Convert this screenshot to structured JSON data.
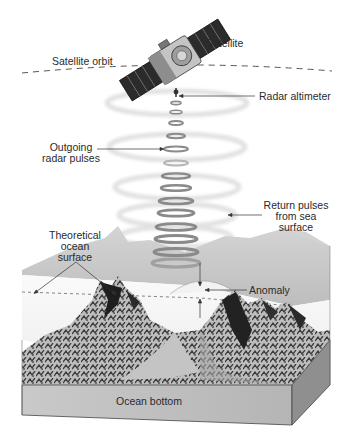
{
  "diagram": {
    "labels": {
      "satellite": "Satellite",
      "satellite_orbit": "Satellite orbit",
      "radar_altimeter": "Radar altimeter",
      "outgoing_pulses_line1": "Outgoing",
      "outgoing_pulses_line2": "radar pulses",
      "return_pulses_line1": "Return pulses",
      "return_pulses_line2": "from sea",
      "return_pulses_line3": "surface",
      "theoretical_line1": "Theoretical",
      "theoretical_line2": "ocean",
      "theoretical_line3": "surface",
      "anomaly": "Anomaly",
      "ocean_bottom": "Ocean bottom"
    },
    "components": [
      "satellite",
      "satellite-orbit",
      "radar-altimeter",
      "outgoing-radar-pulses",
      "return-pulses",
      "sea-surface",
      "theoretical-ocean-surface",
      "anomaly",
      "seafloor-mountains",
      "ocean-bottom"
    ],
    "colors": {
      "background": "#ffffff",
      "solar_panel": "#2b2b2b",
      "satellite_body": "#b9b9b9",
      "pulse_ring": "#8a8a8a",
      "return_ring": "#e4e4e4",
      "sea_surface": "#c8c8c8",
      "water_column": "#f4f4f4",
      "block_front": "#a9a9a9",
      "block_side": "#8f8f8f",
      "mountain_dark": "#1e1e1e",
      "text": "#2a2a2a"
    }
  }
}
